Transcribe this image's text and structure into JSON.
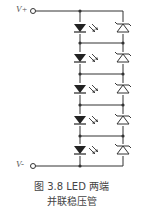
{
  "figure": {
    "terminal_top": "V+",
    "terminal_bottom": "V-",
    "caption_line1": "图 3.8   LED 两端",
    "caption_line2": "并联稳压管"
  },
  "circuit": {
    "led_count": 5,
    "zener_count": 5,
    "stroke_color": "#333333"
  }
}
